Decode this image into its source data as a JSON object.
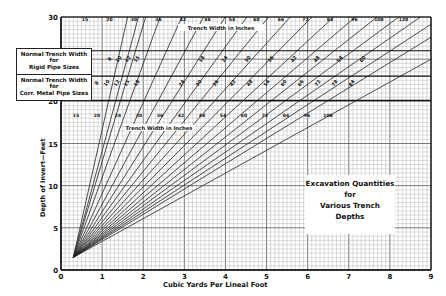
{
  "chart_data": {
    "type": "line",
    "title": "Excavation Quantities for Various Trench Depths",
    "title_lines": [
      "Excavation Quantities",
      "for",
      "Various Trench Depths"
    ],
    "xlabel": "Cubic Yards Per Lineal Foot",
    "ylabel": "Depth of Invert—Feet",
    "xlim": [
      0,
      9
    ],
    "ylim": [
      0,
      30
    ],
    "x_ticks": [
      0,
      1,
      2,
      3,
      4,
      5,
      6,
      7,
      8,
      9
    ],
    "y_ticks": [
      0,
      5,
      10,
      15,
      20,
      30
    ],
    "grid": true,
    "legend_position": "none",
    "series_label_top": "Trench Width in Inches",
    "series_label_lower": "Trench Width in Inches",
    "trench_widths_inches": [
      15,
      18,
      20,
      24,
      30,
      36,
      42,
      48,
      54,
      60,
      66,
      72,
      78,
      84,
      90,
      96,
      102,
      108,
      120
    ],
    "top_labels": [
      "15",
      "20",
      "30",
      "36",
      "42",
      "48",
      "54",
      "60",
      "66",
      "72",
      "84",
      "96",
      "108",
      "120"
    ],
    "lower_labels": [
      "15",
      "20",
      "24",
      "30",
      "36",
      "42",
      "48",
      "54",
      "60",
      "72",
      "84",
      "96",
      "108"
    ],
    "bands": [
      {
        "name": "Normal Trench Width for Rigid Pipe Sizes",
        "label_lines": [
          "Normal Trench Width",
          "for",
          "Rigid Pipe Sizes"
        ],
        "pipe_sizes_inches": [
          "8",
          "10",
          "12",
          "15",
          "18",
          "24",
          "30",
          "36",
          "42",
          "48",
          "54",
          "60"
        ],
        "y_range_ft": [
          23,
          26
        ]
      },
      {
        "name": "Normal Trench Width for Corr. Metal Pipe Sizes",
        "label_lines": [
          "Normal Trench Width",
          "for",
          "Corr. Metal Pipe Sizes"
        ],
        "pipe_sizes_inches": [
          "8",
          "10",
          "12",
          "15",
          "18",
          "24",
          "30",
          "36",
          "42",
          "48",
          "54",
          "60",
          "66",
          "72",
          "78",
          "84"
        ],
        "y_range_ft": [
          20,
          23
        ]
      }
    ],
    "origin_point": {
      "x": 0.3,
      "y": 1.5
    },
    "note": "Each line radiates from origin point; volume per lineal foot = depth × width / 27 (approx)."
  }
}
